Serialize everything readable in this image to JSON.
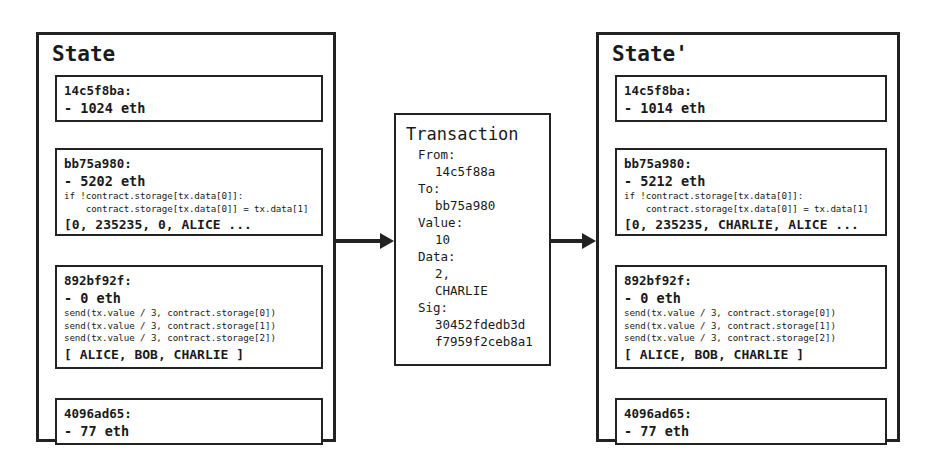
{
  "diagram": {
    "title_left": "State",
    "title_right": "State'",
    "arrows": [
      {
        "name": "state-to-transaction"
      },
      {
        "name": "transaction-to-state-prime"
      }
    ]
  },
  "state_before": {
    "title": "State",
    "accounts": [
      {
        "address": "14c5f8ba:",
        "balance": "- 1024 eth",
        "code": [],
        "storage": ""
      },
      {
        "address": "bb75a980:",
        "balance": "- 5202 eth",
        "code": [
          "if !contract.storage[tx.data[0]]:",
          "    contract.storage[tx.data[0]] = tx.data[1]"
        ],
        "storage": "[0, 235235, 0, ALICE ..."
      },
      {
        "address": "892bf92f:",
        "balance": "- 0 eth",
        "code": [
          "send(tx.value / 3, contract.storage[0])",
          "send(tx.value / 3, contract.storage[1])",
          "send(tx.value / 3, contract.storage[2])"
        ],
        "storage": "[ ALICE, BOB, CHARLIE ]"
      },
      {
        "address": "4096ad65:",
        "balance": "- 77 eth",
        "code": [],
        "storage": ""
      }
    ]
  },
  "transaction": {
    "title": "Transaction",
    "fields": [
      {
        "label": "From:",
        "values": [
          "14c5f88a"
        ]
      },
      {
        "label": "To:",
        "values": [
          "bb75a980"
        ]
      },
      {
        "label": "Value:",
        "values": [
          "10"
        ]
      },
      {
        "label": "Data:",
        "values": [
          "2,",
          "CHARLIE"
        ]
      },
      {
        "label": "Sig:",
        "values": [
          "30452fdedb3d",
          "f7959f2ceb8a1"
        ]
      }
    ]
  },
  "state_after": {
    "title": "State'",
    "accounts": [
      {
        "address": "14c5f8ba:",
        "balance": "- 1014 eth",
        "code": [],
        "storage": ""
      },
      {
        "address": "bb75a980:",
        "balance": "- 5212 eth",
        "code": [
          "if !contract.storage[tx.data[0]]:",
          "    contract.storage[tx.data[0]] = tx.data[1]"
        ],
        "storage": "[0, 235235, CHARLIE, ALICE ..."
      },
      {
        "address": "892bf92f:",
        "balance": "- 0 eth",
        "code": [
          "send(tx.value / 3, contract.storage[0])",
          "send(tx.value / 3, contract.storage[1])",
          "send(tx.value / 3, contract.storage[2])"
        ],
        "storage": "[ ALICE, BOB, CHARLIE ]"
      },
      {
        "address": "4096ad65:",
        "balance": "- 77 eth",
        "code": [],
        "storage": ""
      }
    ]
  },
  "colors": {
    "background": "#ffffff",
    "stroke": "#222222",
    "text": "#1a1a1a"
  }
}
